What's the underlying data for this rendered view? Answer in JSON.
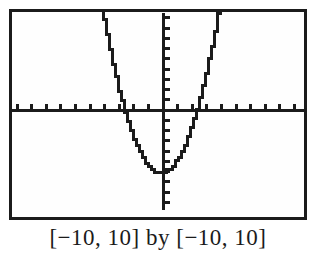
{
  "chart_data": {
    "type": "line",
    "caption": "[−10, 10] by [−10, 10]",
    "window": {
      "xmin": -10,
      "xmax": 10,
      "ymin": -10,
      "ymax": 10
    },
    "x_tick_step": 1,
    "y_tick_step": 1,
    "grid": false,
    "legend": false,
    "function": {
      "expression": "y = x² − 6",
      "coefficients": {
        "a": 1,
        "b": 0,
        "c": -6
      }
    },
    "key_points": {
      "vertex": [
        0,
        -6
      ],
      "x_intercepts": [
        -2.45,
        2.45
      ],
      "y_intercept": [
        0,
        -6
      ]
    },
    "points": [
      [
        -4,
        10
      ],
      [
        -3.5,
        6.25
      ],
      [
        -3,
        3
      ],
      [
        -2.5,
        0.25
      ],
      [
        -2,
        -2
      ],
      [
        -1.5,
        -3.75
      ],
      [
        -1,
        -5
      ],
      [
        -0.5,
        -5.75
      ],
      [
        0,
        -6
      ],
      [
        0.5,
        -5.75
      ],
      [
        1,
        -5
      ],
      [
        1.5,
        -3.75
      ],
      [
        2,
        -2
      ],
      [
        2.5,
        0.25
      ],
      [
        3,
        3
      ],
      [
        3.5,
        6.25
      ],
      [
        4,
        10
      ]
    ],
    "style": {
      "ink": "#1b1b1b",
      "background": "#ffffff",
      "pixelated": true
    }
  }
}
